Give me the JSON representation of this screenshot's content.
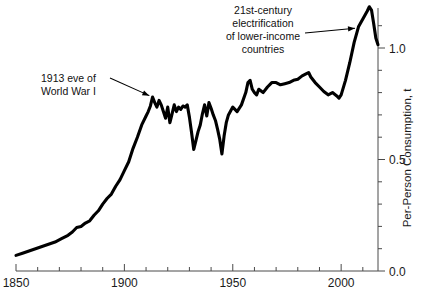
{
  "chart_data": {
    "type": "line",
    "title": "",
    "subtitle": "",
    "xlabel": "",
    "ylabel": "Per-Person Consumption, t",
    "xlim": [
      1850,
      2017
    ],
    "ylim": [
      0.0,
      1.23
    ],
    "grid": false,
    "legend": "none",
    "x_ticks_major": [
      1850,
      1900,
      1950,
      2000
    ],
    "x_tick_labels": [
      "1850",
      "1900",
      "1950",
      "2000"
    ],
    "x_tick_minor_step": 10,
    "y_ticks_major": [
      0.0,
      0.5,
      1.0
    ],
    "y_tick_labels": [
      "0.0",
      "0.5",
      "1.0"
    ],
    "y_tick_minor_step": 0.1,
    "y_axis_side": "right",
    "series": [
      {
        "name": "Per-person consumption",
        "color": "#000000",
        "x": [
          1850,
          1853,
          1856,
          1859,
          1862,
          1865,
          1868,
          1871,
          1874,
          1876,
          1878,
          1880,
          1882,
          1884,
          1886,
          1888,
          1890,
          1892,
          1894,
          1896,
          1898,
          1900,
          1902,
          1904,
          1906,
          1908,
          1910,
          1911,
          1912,
          1913,
          1914,
          1915,
          1916,
          1917,
          1918,
          1919,
          1920,
          1921,
          1922,
          1923,
          1924,
          1925,
          1926,
          1927,
          1928,
          1929,
          1930,
          1931,
          1932,
          1933,
          1934,
          1935,
          1936,
          1937,
          1938,
          1939,
          1940,
          1941,
          1942,
          1943,
          1944,
          1945,
          1946,
          1947,
          1948,
          1950,
          1952,
          1954,
          1956,
          1957,
          1958,
          1959,
          1960,
          1961,
          1962,
          1964,
          1966,
          1968,
          1970,
          1972,
          1974,
          1976,
          1978,
          1980,
          1982,
          1984,
          1985,
          1986,
          1988,
          1990,
          1992,
          1994,
          1996,
          1998,
          1999,
          2000,
          2002,
          2004,
          2006,
          2008,
          2010,
          2012,
          2013,
          2014,
          2015,
          2016,
          2017
        ],
        "y": [
          0.07,
          0.08,
          0.09,
          0.1,
          0.11,
          0.12,
          0.13,
          0.145,
          0.16,
          0.175,
          0.195,
          0.2,
          0.215,
          0.225,
          0.25,
          0.27,
          0.3,
          0.325,
          0.345,
          0.38,
          0.41,
          0.45,
          0.49,
          0.55,
          0.6,
          0.655,
          0.695,
          0.715,
          0.74,
          0.78,
          0.755,
          0.735,
          0.765,
          0.745,
          0.715,
          0.685,
          0.735,
          0.665,
          0.705,
          0.745,
          0.715,
          0.735,
          0.725,
          0.74,
          0.735,
          0.745,
          0.69,
          0.62,
          0.545,
          0.585,
          0.625,
          0.655,
          0.705,
          0.745,
          0.695,
          0.755,
          0.73,
          0.7,
          0.675,
          0.635,
          0.59,
          0.525,
          0.605,
          0.665,
          0.7,
          0.735,
          0.715,
          0.745,
          0.8,
          0.845,
          0.855,
          0.815,
          0.8,
          0.79,
          0.815,
          0.8,
          0.825,
          0.845,
          0.845,
          0.835,
          0.84,
          0.845,
          0.855,
          0.86,
          0.875,
          0.885,
          0.89,
          0.87,
          0.845,
          0.825,
          0.805,
          0.79,
          0.8,
          0.785,
          0.775,
          0.79,
          0.855,
          0.935,
          1.025,
          1.095,
          1.13,
          1.165,
          1.185,
          1.17,
          1.11,
          1.045,
          1.015
        ]
      }
    ],
    "annotations": [
      {
        "id": "annotation-wwi",
        "lines": [
          "1913 eve of",
          "World War I"
        ],
        "text": "1913 eve of World War I",
        "target_x": 1913,
        "target_y": 0.78
      },
      {
        "id": "annotation-electrification",
        "lines": [
          "21st-century",
          "electrification",
          "of lower-income",
          "countries"
        ],
        "text": "21st-century electrification of lower-income countries",
        "target_x": 2008,
        "target_y": 1.09
      }
    ]
  },
  "figure": {
    "background_color": "#ffffff",
    "line_color": "#000000",
    "axis_color": "#4a4a4a",
    "text_color": "#111111"
  }
}
